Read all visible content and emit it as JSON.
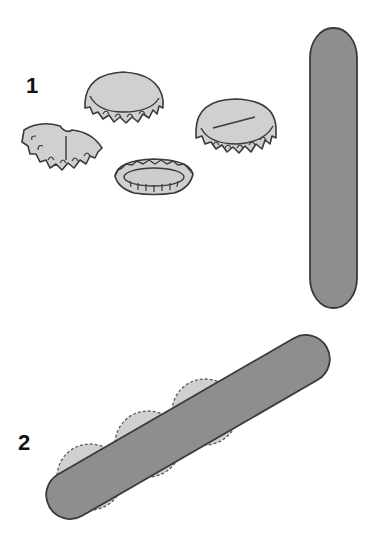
{
  "steps": [
    {
      "number": "1",
      "description": "bottle caps and a stick"
    },
    {
      "number": "2",
      "description": "stick placed over a row of bottle caps"
    }
  ],
  "colors": {
    "background": "#ffffff",
    "cap_fill": "#d0d0d0",
    "stick_fill": "#8e8e8e",
    "outline": "#3a3a3a",
    "label": "#111111"
  }
}
